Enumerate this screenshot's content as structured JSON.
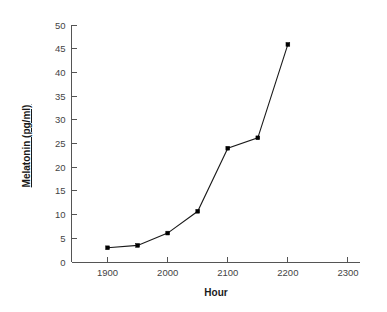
{
  "chart_data": {
    "type": "line",
    "title": "",
    "xlabel": "Hour",
    "ylabel": "Melatonin (pg/ml)",
    "x": [
      1900,
      1950,
      2000,
      2050,
      2100,
      2150,
      2200
    ],
    "values": [
      3,
      3.5,
      6.1,
      10.7,
      24,
      26.2,
      45.9
    ],
    "series": [
      {
        "name": "Melatonin",
        "x": [
          1900,
          1950,
          2000,
          2050,
          2100,
          2150,
          2200
        ],
        "values": [
          3,
          3.5,
          6.1,
          10.7,
          24,
          26.2,
          45.9
        ]
      }
    ],
    "xlim": [
      1840,
      2320
    ],
    "ylim": [
      0,
      50
    ],
    "xticks": [
      1900,
      2000,
      2100,
      2200,
      2300
    ],
    "xtick_labels": [
      "1900",
      "2000",
      "2100",
      "2200",
      "2300"
    ],
    "yticks": [
      0,
      5,
      10,
      15,
      20,
      25,
      30,
      35,
      40,
      45,
      50
    ],
    "ytick_labels": [
      "0",
      "5",
      "10",
      "15",
      "20",
      "25",
      "30",
      "35",
      "40",
      "45",
      "50"
    ],
    "grid": false,
    "legend": false,
    "legend_position": "none",
    "marker": "square",
    "line_color": "#1a1a1a",
    "axis_color": "#555555",
    "background_color": "#ffffff"
  }
}
